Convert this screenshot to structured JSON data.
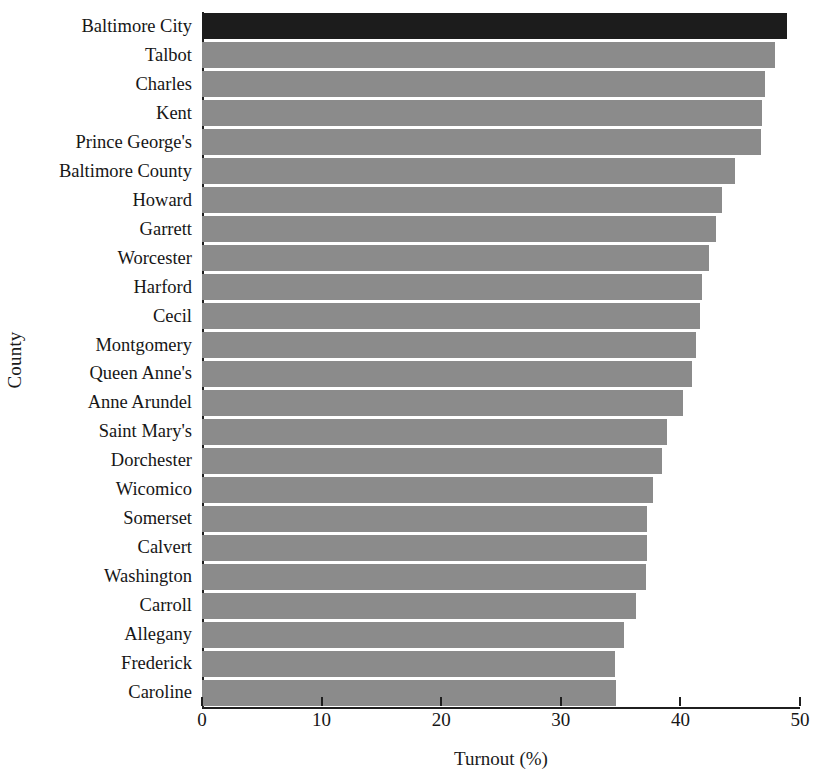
{
  "chart_data": {
    "type": "bar",
    "orientation": "horizontal",
    "title": "",
    "xlabel": "Turnout (%)",
    "ylabel": "County",
    "xlim": [
      0,
      50
    ],
    "xticks": [
      0,
      10,
      20,
      30,
      40,
      50
    ],
    "xtick_labels": [
      "0",
      "10",
      "20",
      "30",
      "40",
      "50"
    ],
    "grid": false,
    "legend": null,
    "categories": [
      "Baltimore City",
      "Talbot",
      "Charles",
      "Kent",
      "Prince George's",
      "Baltimore County",
      "Howard",
      "Garrett",
      "Worcester",
      "Harford",
      "Cecil",
      "Montgomery",
      "Queen Anne's",
      "Anne Arundel",
      "Saint Mary's",
      "Dorchester",
      "Wicomico",
      "Somerset",
      "Calvert",
      "Washington",
      "Carroll",
      "Allegany",
      "Frederick",
      "Caroline"
    ],
    "values": [
      48.9,
      47.9,
      47.1,
      46.8,
      46.7,
      44.6,
      43.5,
      43.0,
      42.4,
      41.8,
      41.6,
      41.3,
      41.0,
      40.2,
      38.9,
      38.5,
      37.7,
      37.2,
      37.2,
      37.1,
      36.3,
      35.3,
      34.5,
      34.6
    ],
    "highlighted_index": 0,
    "colors": {
      "bar": "#8b8b8b",
      "bar_highlight": "#1c1c1c",
      "axis": "#1f1f1f",
      "text": "#161616",
      "background": "#ffffff"
    }
  }
}
